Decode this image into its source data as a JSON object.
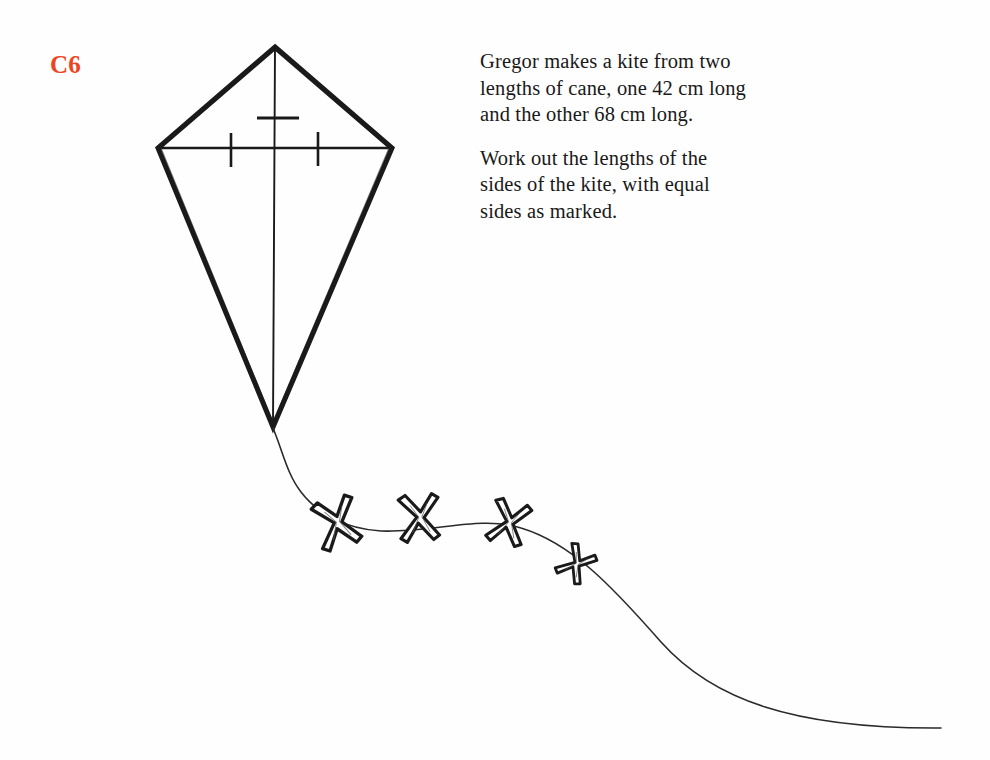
{
  "page": {
    "background_color": "#fefefe",
    "ink_color": "#1a1a1a",
    "label_color": "#ee4422",
    "width": 990,
    "height": 760
  },
  "question": {
    "label": "C6"
  },
  "problem_text": {
    "paragraphs": [
      {
        "id": "intro",
        "lines": [
          "Gregor makes a kite from two",
          "lengths of cane, one 42 cm long",
          "and the other 68 cm long."
        ]
      },
      {
        "id": "task",
        "lines": [
          "Work out the lengths of the",
          "sides of the kite, with equal",
          "sides as marked."
        ]
      }
    ]
  },
  "figure": {
    "name": "kite-with-tail",
    "kite": {
      "apex": [
        275,
        47
      ],
      "left_vertex": [
        158,
        148
      ],
      "right_vertex": [
        393,
        148
      ],
      "bottom_vertex": [
        273,
        427
      ],
      "outline_width": 5,
      "spar_width": 1.8,
      "vertical_spar": [
        [
          275,
          47
        ],
        [
          273,
          427
        ]
      ],
      "horizontal_spar": [
        [
          158,
          148
        ],
        [
          393,
          148
        ]
      ],
      "tick_marks": [
        {
          "name": "vertical-spar-tick",
          "orientation": "horizontal",
          "x1": 257,
          "y1": 118,
          "x2": 299,
          "y2": 118
        },
        {
          "name": "crossbar-tick-left",
          "orientation": "vertical",
          "x1": 231,
          "y1": 133,
          "x2": 231,
          "y2": 167
        },
        {
          "name": "crossbar-tick-right",
          "orientation": "vertical",
          "x1": 318,
          "y1": 132,
          "x2": 318,
          "y2": 166
        }
      ]
    },
    "tail": {
      "path": "M 273 428 C 283 452 288 474 302 492 C 318 513 345 528 380 530 C 430 533 480 516 520 527 C 570 540 610 583 660 640 C 710 697 790 728 940 728",
      "stroke_width": 1.5
    },
    "bows": [
      {
        "name": "tail-bow-1",
        "cx": 338,
        "cy": 524,
        "rotation": -16,
        "scale": 1.08
      },
      {
        "name": "tail-bow-2",
        "cx": 420,
        "cy": 519,
        "rotation": -4,
        "scale": 1.02
      },
      {
        "name": "tail-bow-3",
        "cx": 509,
        "cy": 524,
        "rotation": 16,
        "scale": 0.96
      },
      {
        "name": "tail-bow-4",
        "cx": 576,
        "cy": 565,
        "rotation": 34,
        "scale": 0.78
      }
    ]
  }
}
